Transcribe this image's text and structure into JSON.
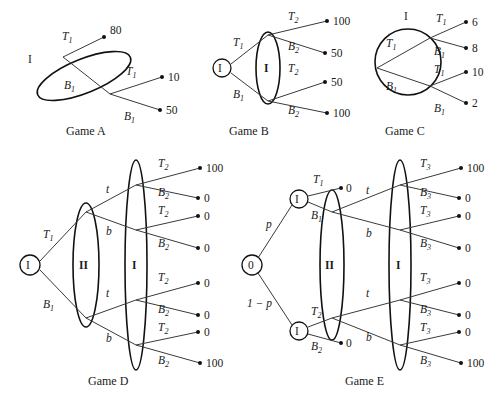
{
  "figure": {
    "background": "#ffffff",
    "ink": "#1a1a1a"
  },
  "games": [
    {
      "id": "game-a",
      "caption": "Game A",
      "root_label": "I",
      "info_sets": [
        {
          "label": "",
          "player": "I",
          "shape": "tilted-oval",
          "nodes": 2
        }
      ],
      "branch_labels": [
        "T",
        "B",
        "T",
        "B"
      ],
      "branch_subs": [
        "1",
        "1",
        "1",
        "1"
      ],
      "payoffs": [
        "80",
        "10",
        "50"
      ]
    },
    {
      "id": "game-b",
      "caption": "Game B",
      "root_label": "I",
      "info_sets": [
        {
          "label": "I",
          "player": "I",
          "shape": "vertical-oval",
          "nodes": 2
        }
      ],
      "first_labels": [
        "T",
        "B"
      ],
      "first_subs": [
        "1",
        "1"
      ],
      "second_labels": [
        "T",
        "B",
        "T",
        "B"
      ],
      "second_subs": [
        "2",
        "2",
        "2",
        "2"
      ],
      "payoffs": [
        "100",
        "50",
        "50",
        "100"
      ]
    },
    {
      "id": "game-c",
      "caption": "Game C",
      "root_label": "",
      "set_label": "I",
      "info_sets": [
        {
          "label": "I",
          "player": "I",
          "shape": "circle",
          "nodes": 2
        }
      ],
      "first_labels": [
        "T",
        "B"
      ],
      "first_subs": [
        "1",
        "1"
      ],
      "second_labels": [
        "T",
        "B",
        "T",
        "B"
      ],
      "second_subs": [
        "1",
        "1",
        "1",
        "1"
      ],
      "payoffs": [
        "6",
        "8",
        "10",
        "2"
      ]
    },
    {
      "id": "game-d",
      "caption": "Game D",
      "root_label": "I",
      "info_sets": [
        {
          "label": "II",
          "player": "II",
          "shape": "vertical-oval",
          "nodes": 2
        },
        {
          "label": "I",
          "player": "I",
          "shape": "vertical-oval",
          "nodes": 4
        }
      ],
      "first_labels": [
        "T",
        "B"
      ],
      "first_subs": [
        "1",
        "1"
      ],
      "mid_labels": [
        "t",
        "b",
        "t",
        "b"
      ],
      "last_labels": [
        "T",
        "B",
        "T",
        "B",
        "T",
        "B",
        "T",
        "B"
      ],
      "last_subs": [
        "2",
        "2",
        "2",
        "2",
        "2",
        "2",
        "2",
        "2"
      ],
      "payoffs": [
        "100",
        "0",
        "0",
        "0",
        "0",
        "0",
        "0",
        "100"
      ]
    },
    {
      "id": "game-e",
      "caption": "Game E",
      "chance_label": "0",
      "chance_probs": [
        "p",
        "1 − p"
      ],
      "player_nodes": [
        "I",
        "I"
      ],
      "first_labels": [
        "T",
        "B",
        "T",
        "B"
      ],
      "first_subs": [
        "1",
        "1",
        "2",
        "2"
      ],
      "exit_payoffs": [
        "0",
        "0"
      ],
      "info_sets": [
        {
          "label": "II",
          "player": "II",
          "shape": "vertical-oval",
          "nodes": 2
        },
        {
          "label": "I",
          "player": "I",
          "shape": "vertical-oval",
          "nodes": 4
        }
      ],
      "mid_labels": [
        "t",
        "b",
        "t",
        "b"
      ],
      "last_labels": [
        "T",
        "B",
        "T",
        "B",
        "T",
        "B",
        "T",
        "B"
      ],
      "last_subs": [
        "3",
        "3",
        "3",
        "3",
        "3",
        "3",
        "3",
        "3"
      ],
      "payoffs": [
        "100",
        "0",
        "0",
        "0",
        "0",
        "0",
        "0",
        "100"
      ]
    }
  ]
}
